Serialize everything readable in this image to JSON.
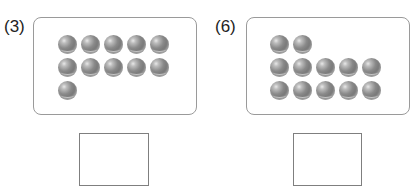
{
  "problems": [
    {
      "label": "(3)",
      "rows": [
        5,
        5,
        1
      ],
      "total_balls": 11,
      "answer_value": ""
    },
    {
      "label": "(6)",
      "rows": [
        2,
        5,
        5
      ],
      "total_balls": 12,
      "answer_value": ""
    }
  ],
  "colors": {
    "panel_border": "#9a9a9a",
    "ball": "#7a7a7a",
    "answer_border": "#7f7f7f"
  }
}
